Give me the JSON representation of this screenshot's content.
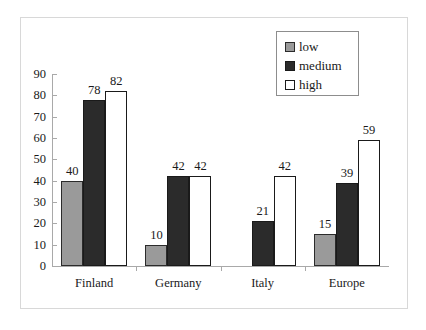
{
  "chart_data": {
    "type": "bar",
    "title": "",
    "subtitle": "",
    "xlabel": "",
    "ylabel": "",
    "categories": [
      "Finland",
      "Germany",
      "Italy",
      "Europe"
    ],
    "series": [
      {
        "name": "low",
        "color": "#9a9a9a",
        "values": [
          40,
          10,
          null,
          15
        ]
      },
      {
        "name": "medium",
        "color": "#2b2b2b",
        "values": [
          78,
          42,
          21,
          39
        ]
      },
      {
        "name": "high",
        "color": "#ffffff",
        "values": [
          82,
          42,
          42,
          59
        ]
      }
    ],
    "ylim": [
      0,
      90
    ],
    "ytick_step": 10,
    "ytick_labels": [
      "0",
      "10",
      "20",
      "30",
      "40",
      "50",
      "60",
      "70",
      "80",
      "90"
    ],
    "data_labels_shown": true,
    "grid": false,
    "legend_position": "top-right",
    "legend_entries": [
      "low",
      "medium",
      "high"
    ]
  },
  "frame": {
    "border_color": "#d8d8d8"
  },
  "axis": {
    "line_color": "#a9a9a9"
  },
  "legend": {
    "border_color": "#8d8d8d",
    "items": [
      {
        "label": "low",
        "swatch": "low-swatch"
      },
      {
        "label": "medium",
        "swatch": "medium-swatch"
      },
      {
        "label": "high",
        "swatch": "high-swatch"
      }
    ]
  }
}
